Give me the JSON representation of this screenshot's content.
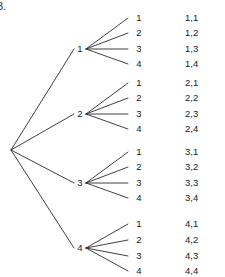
{
  "figure": {
    "number_label": "3.",
    "background_color": "#ffffff",
    "line_color": "#2b2b2b",
    "text_color": "#1a1a1a"
  },
  "chart_data": {
    "type": "diagram",
    "diagram_type": "probability-tree",
    "title": "",
    "root": {
      "label": "",
      "x": 11,
      "y": 150
    },
    "stage1": {
      "label": "",
      "nodes": [
        {
          "label": "1",
          "x": 80,
          "y": 49
        },
        {
          "label": "2",
          "x": 80,
          "y": 114
        },
        {
          "label": "3",
          "x": 80,
          "y": 183
        },
        {
          "label": "4",
          "x": 80,
          "y": 248
        }
      ]
    },
    "stage2": {
      "label": "",
      "leaf_x": 133,
      "outcome_x": 185,
      "groups": [
        {
          "parent": "1",
          "leaves": [
            {
              "label": "1",
              "outcome": "1,1",
              "y": 18
            },
            {
              "label": "2",
              "outcome": "1,2",
              "y": 33
            },
            {
              "label": "3",
              "outcome": "1,3",
              "y": 49
            },
            {
              "label": "4",
              "outcome": "1,4",
              "y": 64
            }
          ]
        },
        {
          "parent": "2",
          "leaves": [
            {
              "label": "1",
              "outcome": "2,1",
              "y": 83
            },
            {
              "label": "2",
              "outcome": "2,2",
              "y": 98
            },
            {
              "label": "3",
              "outcome": "2,3",
              "y": 114
            },
            {
              "label": "4",
              "outcome": "2,4",
              "y": 129
            }
          ]
        },
        {
          "parent": "3",
          "leaves": [
            {
              "label": "1",
              "outcome": "3,1",
              "y": 152
            },
            {
              "label": "2",
              "outcome": "3,2",
              "y": 167
            },
            {
              "label": "3",
              "outcome": "3,3",
              "y": 183
            },
            {
              "label": "4",
              "outcome": "3,4",
              "y": 198
            }
          ]
        },
        {
          "parent": "4",
          "leaves": [
            {
              "label": "1",
              "outcome": "4,1",
              "y": 224
            },
            {
              "label": "2",
              "outcome": "4,2",
              "y": 240
            },
            {
              "label": "3",
              "outcome": "4,3",
              "y": 256
            },
            {
              "label": "4",
              "outcome": "4,4",
              "y": 271
            }
          ]
        }
      ]
    },
    "outcomes": [
      "1,1",
      "1,2",
      "1,3",
      "1,4",
      "2,1",
      "2,2",
      "2,3",
      "2,4",
      "3,1",
      "3,2",
      "3,3",
      "3,4",
      "4,1",
      "4,2",
      "4,3",
      "4,4"
    ],
    "outcome_count": 16
  }
}
